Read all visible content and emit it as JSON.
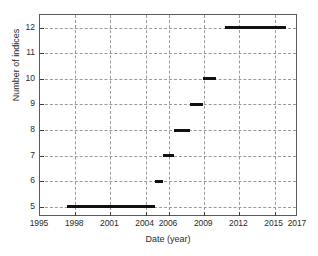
{
  "chart_data": {
    "type": "line",
    "title": "",
    "xlabel": "Date (year)",
    "ylabel": "Number of indices",
    "xlim": [
      1995,
      2017
    ],
    "ylim": [
      4.6,
      12.5
    ],
    "grid": true,
    "legend": null,
    "xticks": [
      1995,
      1998,
      2001,
      2004,
      2006,
      2009,
      2012,
      2015,
      2017
    ],
    "xtick_labels": [
      "1995",
      "1998",
      "2001",
      "2004",
      "2006",
      "2009",
      "2012",
      "2015",
      "2017"
    ],
    "yticks": [
      5,
      6,
      7,
      8,
      9,
      10,
      11,
      12
    ],
    "ytick_labels": [
      "5",
      "6",
      "7",
      "8",
      "9",
      "10",
      "11",
      "12"
    ],
    "series_color": "#111111",
    "grid_color": "#9a9a9a",
    "axis_color": "#5a5a5a",
    "segments": [
      {
        "y": 5,
        "x_start": 1997.3,
        "x_end": 2004.8,
        "label": "5 indices"
      },
      {
        "y": 6,
        "x_start": 2004.8,
        "x_end": 2005.5,
        "label": "6 indices"
      },
      {
        "y": 7,
        "x_start": 2005.5,
        "x_end": 2006.4,
        "label": "7 indices"
      },
      {
        "y": 8,
        "x_start": 2006.4,
        "x_end": 2007.8,
        "label": "8 indices"
      },
      {
        "y": 9,
        "x_start": 2007.8,
        "x_end": 2008.9,
        "label": "9 indices"
      },
      {
        "y": 10,
        "x_start": 2008.9,
        "x_end": 2010.0,
        "label": "10 indices"
      },
      {
        "y": 12,
        "x_start": 2010.8,
        "x_end": 2016.0,
        "label": "12 indices"
      }
    ]
  }
}
